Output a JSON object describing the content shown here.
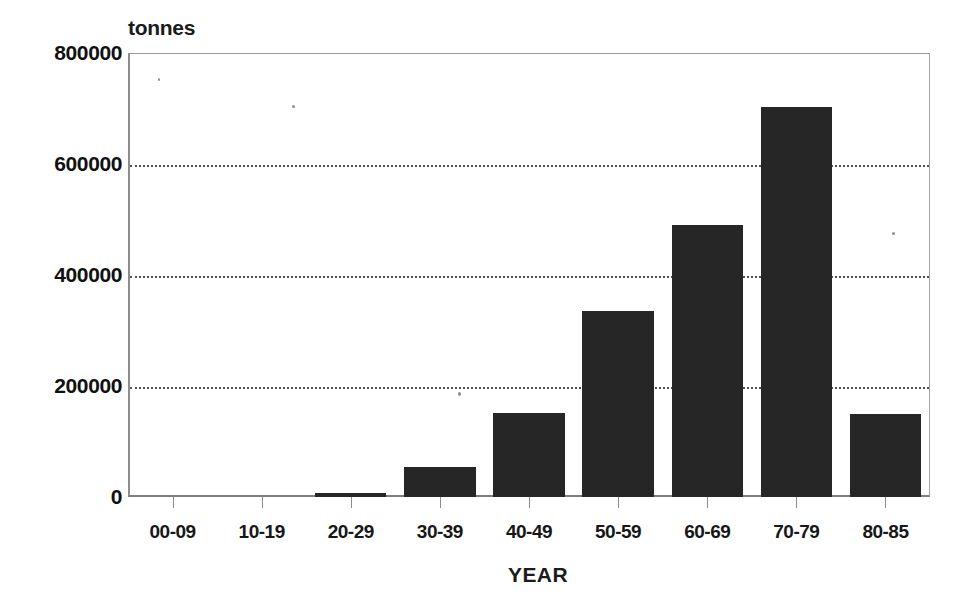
{
  "chart_data": {
    "type": "bar",
    "title": "",
    "subtitle": "",
    "xlabel": "YEAR",
    "ylabel": "tonnes",
    "categories": [
      "00-09",
      "10-19",
      "20-29",
      "30-39",
      "40-49",
      "50-59",
      "60-69",
      "70-79",
      "80-85"
    ],
    "values": [
      0,
      0,
      7000,
      54000,
      151000,
      335000,
      490000,
      703000,
      150000
    ],
    "series": [
      {
        "name": "tonnes",
        "values": [
          0,
          0,
          7000,
          54000,
          151000,
          335000,
          490000,
          703000,
          150000
        ]
      }
    ],
    "ylim": [
      0,
      800000
    ],
    "yticks": [
      0,
      200000,
      400000,
      600000,
      800000
    ],
    "ytick_labels": [
      "0",
      "200000",
      "400000",
      "600000",
      "800000"
    ],
    "grid": true,
    "gridlines": "horizontal-dotted",
    "legend": false,
    "legend_position": "none",
    "bar_color": "#262626",
    "axis_color": "#8b8b8b",
    "gridline_color": "#2b2b2b",
    "annotations": []
  },
  "axis": {
    "y_unit_caption": "tonnes",
    "x_title": "YEAR"
  }
}
